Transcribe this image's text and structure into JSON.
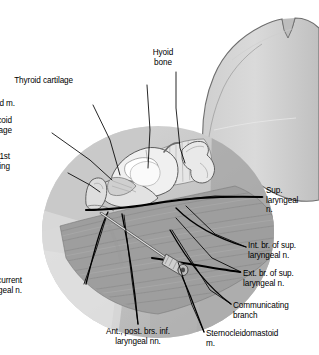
{
  "figure": {
    "type": "anatomical-illustration",
    "palette": {
      "background": "#ffffff",
      "outline": "#4a4a4a",
      "skin_light": "#d9d9d9",
      "skin_mid": "#c2c2c2",
      "skin_dark": "#a8a8a8",
      "field_light": "#cfcfcf",
      "field_mid": "#b5b5b5",
      "muscle": "#9a9a9a",
      "cartilage": "#efefef",
      "membrane": "#e4e4e4",
      "bone": "#e8e8e8",
      "leader_line": "#000000",
      "nerve_line": "#000000",
      "needle": "#d0d0d0"
    }
  },
  "labels": [
    {
      "id": "hyoid-bone",
      "name": "Hyoid bone",
      "lines": [
        "Hyoid",
        "bone"
      ],
      "align": "ctr",
      "x": 163,
      "y": 48,
      "leader": [
        [
          176,
          72
        ],
        [
          176,
          108
        ],
        [
          180,
          148
        ],
        [
          185,
          163
        ]
      ]
    },
    {
      "id": "thyroid-cartilage",
      "name": "Thyroid cartilage",
      "lines": [
        "Thyroid cartilage"
      ],
      "align": "left",
      "x": 73,
      "y": 76,
      "leader": [
        [
          147,
          85
        ],
        [
          150,
          130
        ],
        [
          148,
          168
        ]
      ]
    },
    {
      "id": "cricothyroid-muscle",
      "name": "Cricothyroid m.",
      "lines": [
        "Cricothyroid m."
      ],
      "align": "left",
      "x": 15,
      "y": 99,
      "leader": [
        [
          93,
          105
        ],
        [
          110,
          140
        ],
        [
          120,
          175
        ]
      ]
    },
    {
      "id": "cricoid-cartilage",
      "name": "Cricoid cartilage",
      "lines": [
        "Cricoid",
        "cartilage"
      ],
      "align": "left",
      "x": 12,
      "y": 116,
      "leader": [
        [
          52,
          133
        ],
        [
          90,
          160
        ],
        [
          112,
          180
        ]
      ]
    },
    {
      "id": "first-tracheal-ring",
      "name": "1st tracheal ring",
      "lines": [
        "1st",
        "tracheal ring"
      ],
      "align": "left",
      "x": 10,
      "y": 152,
      "leader": [
        [
          68,
          173
        ],
        [
          90,
          185
        ],
        [
          100,
          192
        ]
      ]
    },
    {
      "id": "sup-laryngeal-n",
      "name": "Sup. laryngeal n.",
      "lines": [
        "Sup.",
        "laryngeal",
        "n."
      ],
      "align": "right",
      "x": 266,
      "y": 186,
      "leader": [
        [
          263,
          197
        ],
        [
          215,
          196
        ],
        [
          178,
          200
        ]
      ]
    },
    {
      "id": "int-br-sup-laryngeal-n",
      "name": "Int. br. of sup. laryngeal n.",
      "lines": [
        "Int. br. of sup.",
        "laryngeal n."
      ],
      "align": "right",
      "x": 248,
      "y": 241,
      "leader": [
        [
          246,
          247
        ],
        [
          215,
          234
        ],
        [
          186,
          206
        ]
      ]
    },
    {
      "id": "ext-br-sup-laryngeal-n",
      "name": "Ext. br. of sup. laryngeal n.",
      "lines": [
        "Ext. br. of sup.",
        "laryngeal n."
      ],
      "align": "right",
      "x": 243,
      "y": 269,
      "leader": [
        [
          241,
          272
        ],
        [
          212,
          258
        ],
        [
          176,
          218
        ]
      ]
    },
    {
      "id": "communicating-branch",
      "name": "Communicating branch",
      "lines": [
        "Communicating",
        "branch"
      ],
      "align": "right",
      "x": 233,
      "y": 301,
      "leader": [
        [
          231,
          304
        ],
        [
          210,
          290
        ],
        [
          172,
          230
        ]
      ]
    },
    {
      "id": "sternocleidomastoid-m",
      "name": "Sternocleidomastoid m.",
      "lines": [
        "Sternocleidomastoid",
        "m."
      ],
      "align": "right",
      "x": 206,
      "y": 329,
      "leader": [
        [
          204,
          332
        ],
        [
          192,
          305
        ],
        [
          178,
          262
        ]
      ]
    },
    {
      "id": "ant-post-brs-inf-laryngeal-nn",
      "name": "Ant., post. brs. inf. laryngeal nn.",
      "lines": [
        "Ant., post. brs. inf.",
        "laryngeal nn."
      ],
      "align": "ctr",
      "x": 138,
      "y": 327,
      "leader": [
        [
          138,
          324
        ],
        [
          132,
          280
        ],
        [
          124,
          215
        ]
      ]
    },
    {
      "id": "recurrent-laryngeal-n",
      "name": "Recurrent laryngeal n.",
      "lines": [
        "Recurrent",
        "laryngeal n."
      ],
      "align": "left",
      "x": 22,
      "y": 276,
      "leader": [
        [
          84,
          284
        ],
        [
          96,
          250
        ],
        [
          106,
          218
        ]
      ]
    }
  ]
}
